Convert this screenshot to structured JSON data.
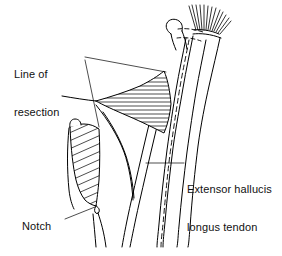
{
  "figure": {
    "type": "anatomical-line-drawing",
    "background_color": "#ffffff",
    "ink_color": "#000000",
    "annotations": {
      "line_of_resection": {
        "text": "Line of\nresection",
        "line1": "Line of",
        "line2": "resection"
      },
      "notch": {
        "text": "Notch"
      },
      "extensor_hallucis_longus_tendon": {
        "text": "Extensor hallucis\nlongus tendon",
        "line1": "Extensor hallucis",
        "line2": "longus tendon"
      }
    },
    "caption_fragment": {
      "text": " "
    },
    "graphic_elements": {
      "hatched_wedge_upper": "horizontal hatching",
      "hatched_block_left": "diagonal hatching",
      "fiber_fan_top": "brush of fine fibers",
      "dashed_tendon": "hidden tendon path shown dashed",
      "notch_marker": "small notch on bone margin"
    }
  }
}
